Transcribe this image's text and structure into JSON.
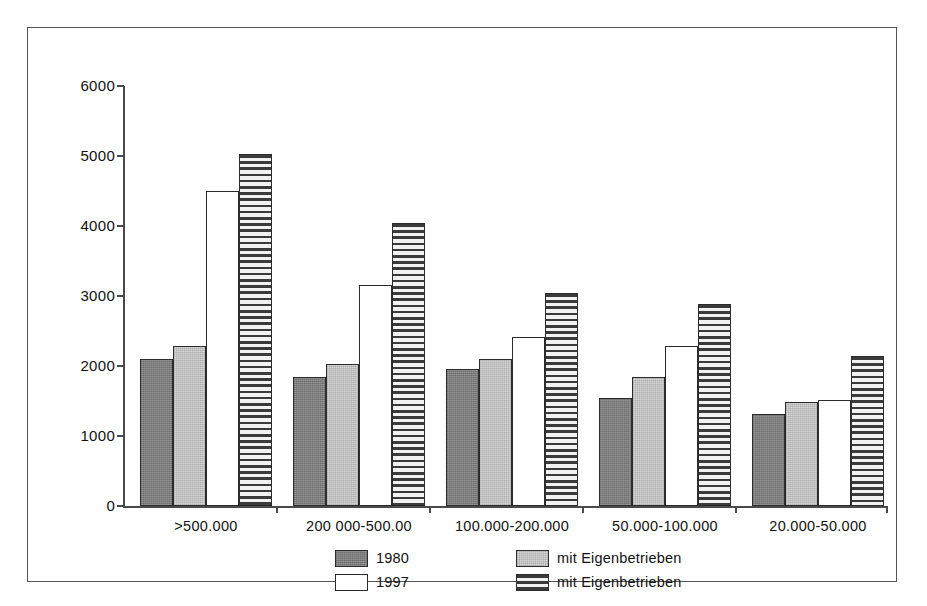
{
  "chart_data": {
    "type": "bar",
    "title": "",
    "subtitle": "",
    "xlabel": "",
    "ylabel": "",
    "ylim": [
      0,
      6000
    ],
    "ytick_labels": [
      "0",
      "1000",
      "2000",
      "3000",
      "4000",
      "5000",
      "6000"
    ],
    "ytick_values": [
      0,
      1000,
      2000,
      3000,
      4000,
      5000,
      6000
    ],
    "grid": false,
    "legend_position": "bottom",
    "categories": [
      ">500.000",
      "200 000-500.00",
      "100.000-200.000",
      "50.000-100.000",
      "20.000-50.000"
    ],
    "series": [
      {
        "name": "1980",
        "style": "dark-gray",
        "values": [
          2100,
          1850,
          1960,
          1540,
          1310
        ]
      },
      {
        "name": "mit Eigenbetrieben",
        "style": "light-gray",
        "values": [
          2280,
          2030,
          2100,
          1850,
          1480
        ]
      },
      {
        "name": "1997",
        "style": "white",
        "values": [
          4500,
          3160,
          2420,
          2290,
          1520
        ]
      },
      {
        "name": "mit Eigenbetrieben",
        "style": "horizontal-hatch",
        "values": [
          5030,
          4050,
          3050,
          2890,
          2150
        ]
      }
    ],
    "legend": [
      {
        "label": "1980",
        "style": "dark-gray",
        "color": "#7d7d7d"
      },
      {
        "label": "mit Eigenbetrieben",
        "style": "light-gray",
        "color": "#d6d6d6"
      },
      {
        "label": "1997",
        "style": "white",
        "color": "#ffffff"
      },
      {
        "label": "mit Eigenbetrieben",
        "style": "horizontal-hatch",
        "color": "#3a3a3a"
      }
    ],
    "colors": {
      "axis": "#4a4a4a",
      "bar_outline": "#2c2c2c",
      "background": "#ffffff",
      "border": "#555555"
    }
  }
}
